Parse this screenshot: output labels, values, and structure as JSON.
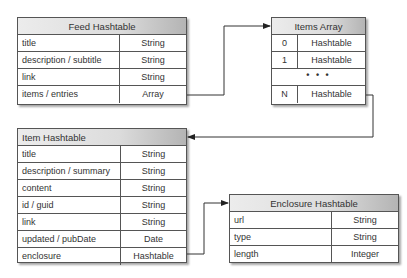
{
  "feed": {
    "title": "Feed Hashtable",
    "rows": [
      {
        "key": "title",
        "type": "String"
      },
      {
        "key": "description / subtitle",
        "type": "String"
      },
      {
        "key": "link",
        "type": "String"
      },
      {
        "key": "items / entries",
        "type": "Array"
      }
    ]
  },
  "items_array": {
    "title": "Items Array",
    "rows": [
      {
        "index": "0",
        "type": "Hashtable"
      },
      {
        "index": "1",
        "type": "Hashtable"
      },
      {
        "ellipsis": "• • •"
      },
      {
        "index": "N",
        "type": "Hashtable"
      }
    ]
  },
  "item": {
    "title": "Item Hashtable",
    "rows": [
      {
        "key": "title",
        "type": "String"
      },
      {
        "key": "description / summary",
        "type": "String"
      },
      {
        "key": "content",
        "type": "String"
      },
      {
        "key": "id / guid",
        "type": "String"
      },
      {
        "key": "link",
        "type": "String"
      },
      {
        "key": "updated / pubDate",
        "type": "Date"
      },
      {
        "key": "enclosure",
        "type": "Hashtable"
      }
    ]
  },
  "enclosure": {
    "title": "Enclosure Hashtable",
    "rows": [
      {
        "key": "url",
        "type": "String"
      },
      {
        "key": "type",
        "type": "String"
      },
      {
        "key": "length",
        "type": "Integer"
      }
    ]
  },
  "connectors": [
    {
      "from": "feed.items / entries",
      "to": "items_array"
    },
    {
      "from": "items_array.N",
      "to": "item"
    },
    {
      "from": "item.enclosure",
      "to": "enclosure"
    }
  ]
}
